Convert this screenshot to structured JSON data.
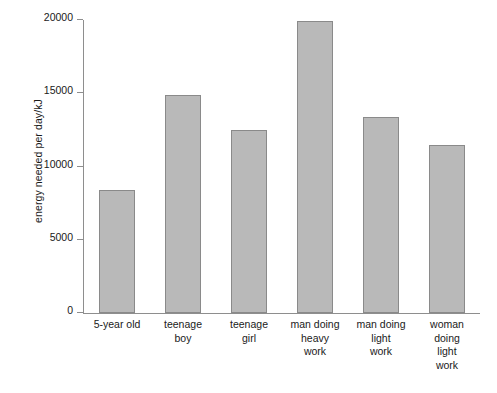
{
  "chart_data": {
    "type": "bar",
    "title": "",
    "xlabel": "",
    "ylabel": "energy needed per day/kJ",
    "ylim": [
      0,
      20000
    ],
    "ytick_values": [
      0,
      5000,
      10000,
      15000,
      20000
    ],
    "ytick_labels": [
      "0",
      "5000",
      "10000",
      "15000",
      "20000"
    ],
    "grid": false,
    "legend": false,
    "categories": [
      "5-year old",
      "teenage\nboy",
      "teenage\ngirl",
      "man doing\nheavy\nwork",
      "man doing\nlight\nwork",
      "woman\ndoing\nlight\nwork"
    ],
    "values": [
      8400,
      14900,
      12500,
      19900,
      13400,
      11500
    ],
    "bar_color": "#b9b9b9",
    "bar_edge_color": "#8a8a8a",
    "axis_color": "#8e8e8e",
    "background_color": "#ffffff"
  }
}
